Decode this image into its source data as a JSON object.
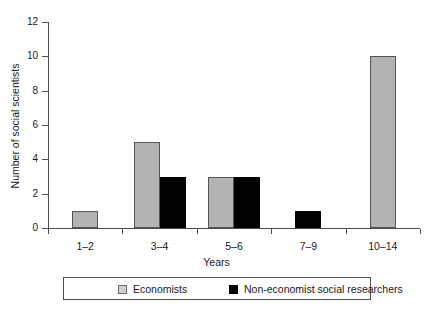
{
  "chart_data": {
    "type": "bar",
    "title": "",
    "xlabel": "Years",
    "ylabel": "Number of social scientists",
    "categories": [
      "1–2",
      "3–4",
      "5–6",
      "7–9",
      "10–14"
    ],
    "series": [
      {
        "name": "Economists",
        "color": "#b3b3b3",
        "values": [
          1,
          5,
          3,
          0,
          10
        ]
      },
      {
        "name": "Non-economist social researchers",
        "color": "#000000",
        "values": [
          0,
          3,
          3,
          1,
          0
        ]
      }
    ],
    "ylim": [
      0,
      12
    ],
    "yticks": [
      0,
      2,
      4,
      6,
      8,
      10,
      12
    ],
    "ytick_labels": [
      "0",
      "2",
      "4",
      "6",
      "8",
      "10",
      "12"
    ],
    "grid": false,
    "legend_position": "bottom"
  },
  "legend": {
    "items": [
      {
        "label": "Economists",
        "swatch": "economists"
      },
      {
        "label": "Non-economist social researchers",
        "swatch": "noneconomists"
      }
    ]
  }
}
